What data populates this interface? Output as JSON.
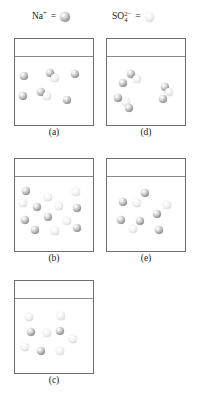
{
  "figure": {
    "type": "particulate-representation-diagram",
    "legend": {
      "items": [
        {
          "id": "na",
          "formula_base": "Na",
          "charge": "+",
          "subscript": "",
          "equals": "=",
          "sphere_style": "dark-gray-sphere",
          "color": "#9d9d9d"
        },
        {
          "id": "so4",
          "formula_base": "SO",
          "charge": "2−",
          "subscript": "4",
          "equals": "=",
          "sphere_style": "light-gray-sphere",
          "color": "#e2e2e2"
        }
      ]
    },
    "beakers": [
      {
        "id": "a",
        "caption": "(a)",
        "particles": [
          {
            "type": "na",
            "x": 9,
            "y": 20,
            "r": 4.0
          },
          {
            "type": "na",
            "x": 35,
            "y": 17,
            "r": 4.0
          },
          {
            "type": "so4",
            "x": 40,
            "y": 22,
            "r": 3.6
          },
          {
            "type": "na",
            "x": 60,
            "y": 18,
            "r": 4.0
          },
          {
            "type": "na",
            "x": 8,
            "y": 40,
            "r": 4.0
          },
          {
            "type": "na",
            "x": 26,
            "y": 36,
            "r": 4.0
          },
          {
            "type": "so4",
            "x": 32,
            "y": 40,
            "r": 3.6
          },
          {
            "type": "na",
            "x": 52,
            "y": 44,
            "r": 4.0
          }
        ]
      },
      {
        "id": "d",
        "caption": "(d)",
        "particles": [
          {
            "type": "na",
            "x": 24,
            "y": 18,
            "r": 4.0
          },
          {
            "type": "so4",
            "x": 30,
            "y": 23,
            "r": 3.6
          },
          {
            "type": "na",
            "x": 16,
            "y": 27,
            "r": 4.0
          },
          {
            "type": "na",
            "x": 58,
            "y": 31,
            "r": 4.0
          },
          {
            "type": "so4",
            "x": 62,
            "y": 36,
            "r": 3.6
          },
          {
            "type": "na",
            "x": 56,
            "y": 43,
            "r": 4.0
          },
          {
            "type": "na",
            "x": 11,
            "y": 42,
            "r": 4.0
          },
          {
            "type": "so4",
            "x": 19,
            "y": 46,
            "r": 3.6
          },
          {
            "type": "na",
            "x": 22,
            "y": 52,
            "r": 4.0
          }
        ]
      },
      {
        "id": "b",
        "caption": "(b)",
        "particles": [
          {
            "type": "na",
            "x": 11,
            "y": 15,
            "r": 4.0
          },
          {
            "type": "so4",
            "x": 33,
            "y": 21,
            "r": 3.6
          },
          {
            "type": "so4",
            "x": 61,
            "y": 16,
            "r": 3.6
          },
          {
            "type": "so4",
            "x": 8,
            "y": 27,
            "r": 3.6
          },
          {
            "type": "na",
            "x": 22,
            "y": 31,
            "r": 4.0
          },
          {
            "type": "so4",
            "x": 44,
            "y": 30,
            "r": 3.6
          },
          {
            "type": "na",
            "x": 62,
            "y": 32,
            "r": 4.0
          },
          {
            "type": "na",
            "x": 10,
            "y": 44,
            "r": 4.0
          },
          {
            "type": "na",
            "x": 33,
            "y": 41,
            "r": 4.0
          },
          {
            "type": "so4",
            "x": 52,
            "y": 45,
            "r": 3.6
          },
          {
            "type": "na",
            "x": 20,
            "y": 54,
            "r": 4.0
          },
          {
            "type": "so4",
            "x": 40,
            "y": 55,
            "r": 3.6
          },
          {
            "type": "na",
            "x": 62,
            "y": 52,
            "r": 4.0
          }
        ]
      },
      {
        "id": "e",
        "caption": "(e)",
        "particles": [
          {
            "type": "na",
            "x": 38,
            "y": 17,
            "r": 4.0
          },
          {
            "type": "na",
            "x": 16,
            "y": 26,
            "r": 4.0
          },
          {
            "type": "so4",
            "x": 30,
            "y": 27,
            "r": 3.6
          },
          {
            "type": "so4",
            "x": 60,
            "y": 29,
            "r": 3.6
          },
          {
            "type": "na",
            "x": 50,
            "y": 38,
            "r": 4.0
          },
          {
            "type": "na",
            "x": 14,
            "y": 44,
            "r": 4.0
          },
          {
            "type": "na",
            "x": 33,
            "y": 45,
            "r": 4.0
          },
          {
            "type": "so4",
            "x": 26,
            "y": 53,
            "r": 3.6
          },
          {
            "type": "na",
            "x": 52,
            "y": 54,
            "r": 4.0
          }
        ]
      },
      {
        "id": "c",
        "caption": "(c)",
        "particles": [
          {
            "type": "so4",
            "x": 14,
            "y": 19,
            "r": 3.6
          },
          {
            "type": "so4",
            "x": 46,
            "y": 18,
            "r": 3.6
          },
          {
            "type": "na",
            "x": 16,
            "y": 34,
            "r": 4.0
          },
          {
            "type": "so4",
            "x": 32,
            "y": 35,
            "r": 3.6
          },
          {
            "type": "na",
            "x": 45,
            "y": 33,
            "r": 4.0
          },
          {
            "type": "so4",
            "x": 58,
            "y": 41,
            "r": 3.6
          },
          {
            "type": "so4",
            "x": 10,
            "y": 49,
            "r": 3.6
          },
          {
            "type": "na",
            "x": 26,
            "y": 53,
            "r": 4.0
          },
          {
            "type": "so4",
            "x": 45,
            "y": 53,
            "r": 3.6
          }
        ]
      }
    ]
  }
}
